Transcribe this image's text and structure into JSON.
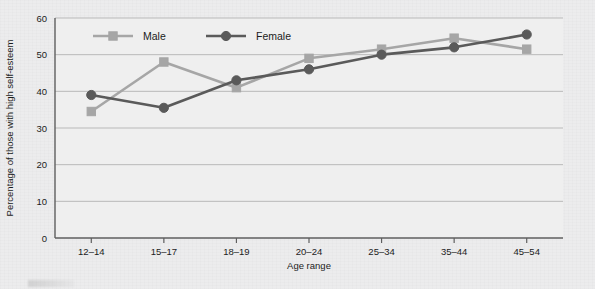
{
  "chart_data": {
    "type": "line",
    "title": "",
    "subtitle": "",
    "xlabel": "Age range",
    "ylabel": "Percentage of those with high self-esteem",
    "categories": [
      "12–14",
      "15–17",
      "18–19",
      "20–24",
      "25–34",
      "35–44",
      "45–54"
    ],
    "ylim": [
      0,
      60
    ],
    "yticks": [
      0,
      10,
      20,
      30,
      40,
      50,
      60
    ],
    "ytick_labels": [
      "0",
      "10",
      "20",
      "30",
      "40",
      "50",
      "60"
    ],
    "grid": "horizontal",
    "legend_position": "inside-top",
    "series": [
      {
        "name": "Male",
        "color": "#a6a6a6",
        "marker": "square",
        "values": [
          34.5,
          48.0,
          41.0,
          49.0,
          51.5,
          54.5,
          51.5
        ]
      },
      {
        "name": "Female",
        "color": "#5a5a5a",
        "marker": "circle",
        "values": [
          39.0,
          35.5,
          43.0,
          46.0,
          50.0,
          52.0,
          55.5
        ]
      }
    ]
  },
  "colors": {
    "background": "#ececed",
    "plot_background": "#efefef",
    "axis": "#5f5f5f",
    "gridline": "#b9b9b9",
    "text": "#1c1c1c",
    "male": "#a6a6a6",
    "female": "#5a5a5a"
  },
  "legend": {
    "items": [
      {
        "label": "Male",
        "color": "#a6a6a6",
        "marker": "square"
      },
      {
        "label": "Female",
        "color": "#5a5a5a",
        "marker": "circle"
      }
    ]
  }
}
